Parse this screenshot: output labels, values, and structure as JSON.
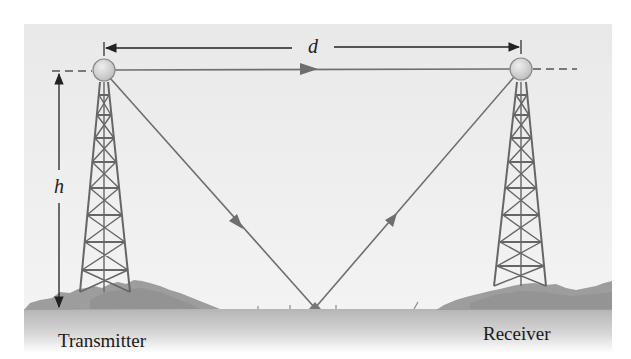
{
  "diagram": {
    "type": "line-of-sight and ground-reflected radio propagation",
    "labels": {
      "distance": "d",
      "height": "h",
      "transmitter": "Transmitter",
      "receiver": "Receiver"
    },
    "elements": {
      "transmitter_tower": {
        "antenna_center": [
          104,
          70
        ],
        "base_left": 80,
        "base_right": 130,
        "base_y": 292
      },
      "receiver_tower": {
        "antenna_center": [
          521,
          69
        ],
        "base_left": 494,
        "base_right": 546,
        "base_y": 286
      },
      "direct_path": {
        "from": "transmitter",
        "to": "receiver",
        "arrow_at": [
          312,
          69
        ]
      },
      "reflected_path": {
        "bounce_point": [
          315,
          308
        ],
        "arrow_down_at": [
          236,
          222
        ],
        "arrow_up_at": [
          391,
          220
        ]
      },
      "distance_dimension": {
        "y": 47,
        "x_start": 104,
        "x_end": 521
      },
      "height_dimension": {
        "x": 59,
        "y_top": 71,
        "y_bottom": 309
      }
    },
    "colors": {
      "background_panel": "#eeeeee",
      "ground": "#bdbdbd",
      "bushes": "#9a9a9a",
      "tower": "#666666",
      "ray": "#6e6e6e",
      "dimension": "#222222",
      "antenna_fill": "#d4d4d4",
      "antenna_stroke": "#8a8a8a"
    }
  }
}
